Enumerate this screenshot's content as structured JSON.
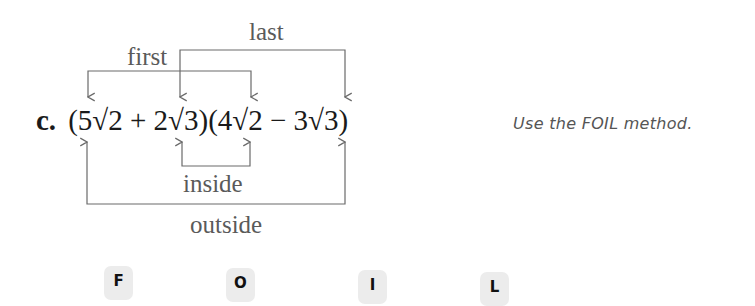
{
  "problem": {
    "letter": "c.",
    "expression_parts": [
      "(5",
      "√2",
      " + 2",
      "√3",
      ")(4",
      "√2",
      " − 3",
      "√3",
      ")"
    ],
    "labels": {
      "first": "first",
      "last": "last",
      "inside": "inside",
      "outside": "outside"
    },
    "hint": "Use the FOIL method."
  },
  "foil_tiles": [
    "F",
    "O",
    "I",
    "L"
  ],
  "colors": {
    "bracket": "#6a6a6a",
    "text": "#1a1a1a",
    "tile_bg": "#ececec"
  }
}
